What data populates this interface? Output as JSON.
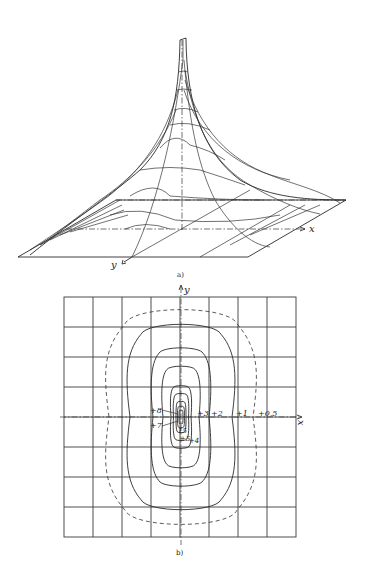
{
  "figure": {
    "part_a": {
      "caption": "a)",
      "axis_x_label": "x",
      "axis_y_label": "y",
      "description": "3D surface plot of a sharp peak decaying toward a flat plane"
    },
    "part_b": {
      "caption": "b)",
      "axis_x_label": "x",
      "axis_y_label": "y",
      "grid": {
        "columns": 8,
        "rows": 8
      },
      "contour_labels": [
        "+8",
        "+7",
        "15",
        "+5",
        "+4",
        "+3",
        "+2",
        "+1",
        "+0,5"
      ],
      "contours": [
        {
          "label": "+0,5",
          "style": "dashed"
        },
        {
          "label": "+1",
          "style": "solid"
        },
        {
          "label": "+2",
          "style": "solid"
        },
        {
          "label": "+3",
          "style": "solid"
        },
        {
          "label": "+4",
          "style": "solid"
        },
        {
          "label": "+5",
          "style": "solid"
        },
        {
          "label": "15",
          "style": "solid"
        },
        {
          "label": "+7",
          "style": "solid"
        },
        {
          "label": "+8",
          "style": "solid"
        }
      ]
    }
  }
}
